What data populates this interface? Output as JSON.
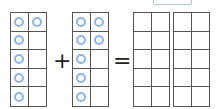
{
  "answer_box": {
    "value": ""
  },
  "operators": {
    "plus": "+",
    "equals": "="
  },
  "ten_frames": [
    {
      "id": "addend-1",
      "counters": [
        true,
        true,
        true,
        false,
        true,
        false,
        true,
        false,
        true,
        false
      ]
    },
    {
      "id": "addend-2",
      "counters": [
        true,
        true,
        true,
        true,
        true,
        false,
        true,
        false,
        true,
        false
      ]
    },
    {
      "id": "sum-1",
      "counters": [
        false,
        false,
        false,
        false,
        false,
        false,
        false,
        false,
        false,
        false
      ]
    },
    {
      "id": "sum-2",
      "counters": [
        false,
        false,
        false,
        false,
        false,
        false,
        false,
        false,
        false,
        false
      ]
    }
  ],
  "colors": {
    "counter": "#8db4e8",
    "grid": "#555555",
    "answer_border": "#a9c6ec"
  }
}
